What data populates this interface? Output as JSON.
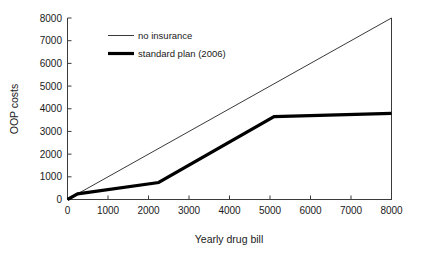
{
  "chart_data": {
    "type": "line",
    "title": "",
    "xlabel": "Yearly drug bill",
    "ylabel": "OOP costs",
    "xlim": [
      0,
      8000
    ],
    "ylim": [
      0,
      8000
    ],
    "xticks": [
      0,
      1000,
      2000,
      3000,
      4000,
      5000,
      6000,
      7000,
      8000
    ],
    "yticks": [
      0,
      1000,
      2000,
      3000,
      4000,
      5000,
      6000,
      7000,
      8000
    ],
    "xtick_labels": [
      "0",
      "1000",
      "2000",
      "3000",
      "4000",
      "5000",
      "6000",
      "7000",
      "8000"
    ],
    "ytick_labels": [
      "0",
      "1000",
      "2000",
      "3000",
      "4000",
      "5000",
      "6000",
      "7000",
      "8000"
    ],
    "grid": false,
    "legend_position": "top-left",
    "series": [
      {
        "name": "no insurance",
        "style": "thin",
        "color": "#222222",
        "x": [
          0,
          8000
        ],
        "values": [
          0,
          8000
        ]
      },
      {
        "name": "standard plan (2006)",
        "style": "thick",
        "color": "#000000",
        "x": [
          0,
          250,
          2250,
          5100,
          8000
        ],
        "values": [
          0,
          250,
          750,
          3650,
          3800
        ]
      }
    ]
  },
  "axes": {
    "x_title": "Yearly drug bill",
    "y_title": "OOP costs"
  },
  "legend": {
    "entries": [
      {
        "label": "no insurance"
      },
      {
        "label": "standard plan (2006)"
      }
    ]
  }
}
